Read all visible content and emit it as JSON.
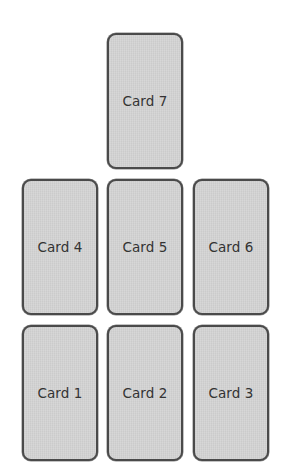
{
  "layout": {
    "card_width": 76,
    "card_height": 136,
    "columns_x": [
      22,
      107,
      193
    ],
    "rows_y": [
      33,
      179,
      325
    ]
  },
  "colors": {
    "card_fill": "#d3d3d3",
    "card_border": "#4a4a4a",
    "label_text": "#333333",
    "background": "#ffffff"
  },
  "cards": [
    {
      "id": 1,
      "label": "Card 1",
      "row": 3,
      "col": 1
    },
    {
      "id": 2,
      "label": "Card 2",
      "row": 3,
      "col": 2
    },
    {
      "id": 3,
      "label": "Card 3",
      "row": 3,
      "col": 3
    },
    {
      "id": 4,
      "label": "Card 4",
      "row": 2,
      "col": 1
    },
    {
      "id": 5,
      "label": "Card 5",
      "row": 2,
      "col": 2
    },
    {
      "id": 6,
      "label": "Card 6",
      "row": 2,
      "col": 3
    },
    {
      "id": 7,
      "label": "Card 7",
      "row": 1,
      "col": 2
    }
  ]
}
